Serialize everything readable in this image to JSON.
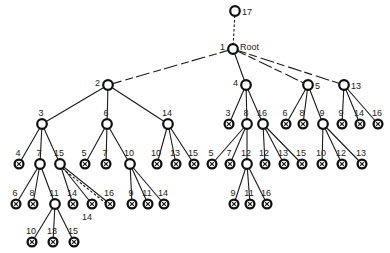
{
  "diagram": {
    "colors": {
      "line": "#1a1a1a",
      "node_stroke": "#111111",
      "node_fill": "#ffffff",
      "text": "#222222"
    },
    "legend": {
      "internal_node": "open circle",
      "leaf_node": "circle with cross (crossed-out)"
    },
    "nodes": [
      {
        "id": "n17",
        "label": "17",
        "x": 235,
        "y": 11,
        "type": "internal",
        "lpos": "right"
      },
      {
        "id": "n1",
        "label": "1",
        "sublabel": "Root",
        "x": 233,
        "y": 49,
        "type": "internal",
        "lpos": "left"
      },
      {
        "id": "n2",
        "label": "2",
        "x": 108,
        "y": 85,
        "type": "internal",
        "lpos": "left"
      },
      {
        "id": "n4",
        "label": "4",
        "x": 246,
        "y": 85,
        "type": "internal",
        "lpos": "left"
      },
      {
        "id": "n5",
        "label": "5",
        "x": 308,
        "y": 85,
        "type": "internal",
        "lpos": "right"
      },
      {
        "id": "n13",
        "label": "13",
        "x": 344,
        "y": 85,
        "type": "internal",
        "lpos": "right"
      },
      {
        "id": "a3",
        "label": "3",
        "x": 42,
        "y": 124,
        "type": "internal"
      },
      {
        "id": "a6",
        "label": "6",
        "x": 107,
        "y": 124,
        "type": "internal"
      },
      {
        "id": "a14",
        "label": "14",
        "x": 168,
        "y": 124,
        "type": "internal"
      },
      {
        "id": "b3",
        "label": "3",
        "x": 229,
        "y": 124,
        "type": "leaf"
      },
      {
        "id": "b8",
        "label": "8",
        "x": 247,
        "y": 124,
        "type": "internal"
      },
      {
        "id": "b16",
        "label": "16",
        "x": 263,
        "y": 124,
        "type": "internal"
      },
      {
        "id": "c6",
        "label": "6",
        "x": 286,
        "y": 124,
        "type": "leaf"
      },
      {
        "id": "c8",
        "label": "8",
        "x": 303,
        "y": 124,
        "type": "leaf"
      },
      {
        "id": "c9",
        "label": "9",
        "x": 323,
        "y": 124,
        "type": "internal"
      },
      {
        "id": "d9",
        "label": "9",
        "x": 342,
        "y": 124,
        "type": "leaf"
      },
      {
        "id": "d14",
        "label": "14",
        "x": 360,
        "y": 124,
        "type": "leaf"
      },
      {
        "id": "d16",
        "label": "16",
        "x": 378,
        "y": 124,
        "type": "leaf"
      },
      {
        "id": "e4",
        "label": "4",
        "x": 19,
        "y": 164,
        "type": "leaf"
      },
      {
        "id": "e7",
        "label": "7",
        "x": 40,
        "y": 164,
        "type": "internal"
      },
      {
        "id": "e15",
        "label": "15",
        "x": 60,
        "y": 164,
        "type": "internal"
      },
      {
        "id": "f5",
        "label": "5",
        "x": 85,
        "y": 164,
        "type": "leaf"
      },
      {
        "id": "f7",
        "label": "7",
        "x": 106,
        "y": 164,
        "type": "leaf"
      },
      {
        "id": "f10",
        "label": "10",
        "x": 130,
        "y": 164,
        "type": "internal"
      },
      {
        "id": "g10",
        "label": "10",
        "x": 157,
        "y": 164,
        "type": "leaf"
      },
      {
        "id": "g13",
        "label": "13",
        "x": 176,
        "y": 164,
        "type": "leaf"
      },
      {
        "id": "g15",
        "label": "15",
        "x": 194,
        "y": 164,
        "type": "leaf"
      },
      {
        "id": "h5",
        "label": "5",
        "x": 212,
        "y": 164,
        "type": "leaf"
      },
      {
        "id": "h7",
        "label": "7",
        "x": 230,
        "y": 164,
        "type": "leaf"
      },
      {
        "id": "h12",
        "label": "12",
        "x": 247,
        "y": 164,
        "type": "internal"
      },
      {
        "id": "i12",
        "label": "12",
        "x": 265,
        "y": 164,
        "type": "leaf"
      },
      {
        "id": "i13",
        "label": "13",
        "x": 284,
        "y": 164,
        "type": "leaf"
      },
      {
        "id": "i15",
        "label": "15",
        "x": 302,
        "y": 164,
        "type": "leaf"
      },
      {
        "id": "j10",
        "label": "10",
        "x": 322,
        "y": 164,
        "type": "leaf"
      },
      {
        "id": "j12",
        "label": "12",
        "x": 342,
        "y": 164,
        "type": "leaf"
      },
      {
        "id": "j13",
        "label": "13",
        "x": 362,
        "y": 164,
        "type": "leaf"
      },
      {
        "id": "k6",
        "label": "6",
        "x": 16,
        "y": 204,
        "type": "leaf"
      },
      {
        "id": "k8",
        "label": "8",
        "x": 33,
        "y": 204,
        "type": "leaf"
      },
      {
        "id": "k11",
        "label": "11",
        "x": 55,
        "y": 204,
        "type": "internal"
      },
      {
        "id": "l14",
        "label": "14",
        "x": 73,
        "y": 204,
        "type": "leaf"
      },
      {
        "id": "l14b",
        "label": "14",
        "x": 92,
        "y": 204,
        "type": "leaf",
        "lpos": "below"
      },
      {
        "id": "l16",
        "label": "16",
        "x": 110,
        "y": 204,
        "type": "leaf"
      },
      {
        "id": "m9",
        "label": "9",
        "x": 132,
        "y": 204,
        "type": "leaf"
      },
      {
        "id": "m11",
        "label": "11",
        "x": 148,
        "y": 204,
        "type": "leaf"
      },
      {
        "id": "m14",
        "label": "14",
        "x": 164,
        "y": 204,
        "type": "leaf"
      },
      {
        "id": "o9",
        "label": "9",
        "x": 234,
        "y": 204,
        "type": "leaf"
      },
      {
        "id": "o11",
        "label": "11",
        "x": 250,
        "y": 204,
        "type": "leaf"
      },
      {
        "id": "o16",
        "label": "16",
        "x": 267,
        "y": 204,
        "type": "leaf"
      },
      {
        "id": "p10",
        "label": "10",
        "x": 32,
        "y": 242,
        "type": "leaf"
      },
      {
        "id": "p13",
        "label": "13",
        "x": 53,
        "y": 242,
        "type": "leaf"
      },
      {
        "id": "p15",
        "label": "15",
        "x": 74,
        "y": 242,
        "type": "leaf"
      }
    ],
    "edges": [
      {
        "from": "n17",
        "to": "n1",
        "style": "dashed"
      },
      {
        "from": "n1",
        "to": "n2",
        "style": "broken"
      },
      {
        "from": "n1",
        "to": "n4",
        "style": "solid"
      },
      {
        "from": "n1",
        "to": "n5",
        "style": "broken"
      },
      {
        "from": "n1",
        "to": "n13",
        "style": "broken"
      },
      {
        "from": "n2",
        "to": "a3",
        "style": "solid"
      },
      {
        "from": "n2",
        "to": "a6",
        "style": "solid"
      },
      {
        "from": "n2",
        "to": "a14",
        "style": "solid"
      },
      {
        "from": "n4",
        "to": "b3",
        "style": "solid"
      },
      {
        "from": "n4",
        "to": "b8",
        "style": "solid"
      },
      {
        "from": "n4",
        "to": "b16",
        "style": "solid"
      },
      {
        "from": "n5",
        "to": "c6",
        "style": "solid"
      },
      {
        "from": "n5",
        "to": "c8",
        "style": "solid"
      },
      {
        "from": "n5",
        "to": "c9",
        "style": "solid"
      },
      {
        "from": "n13",
        "to": "d9",
        "style": "solid"
      },
      {
        "from": "n13",
        "to": "d14",
        "style": "solid"
      },
      {
        "from": "n13",
        "to": "d16",
        "style": "solid"
      },
      {
        "from": "a3",
        "to": "e4",
        "style": "solid"
      },
      {
        "from": "a3",
        "to": "e7",
        "style": "solid"
      },
      {
        "from": "a3",
        "to": "e15",
        "style": "solid"
      },
      {
        "from": "a6",
        "to": "f5",
        "style": "solid"
      },
      {
        "from": "a6",
        "to": "f7",
        "style": "solid"
      },
      {
        "from": "a6",
        "to": "f10",
        "style": "solid"
      },
      {
        "from": "a14",
        "to": "g10",
        "style": "solid"
      },
      {
        "from": "a14",
        "to": "g13",
        "style": "solid"
      },
      {
        "from": "a14",
        "to": "g15",
        "style": "solid"
      },
      {
        "from": "b8",
        "to": "h5",
        "style": "solid"
      },
      {
        "from": "b8",
        "to": "h7",
        "style": "solid"
      },
      {
        "from": "b8",
        "to": "h12",
        "style": "solid"
      },
      {
        "from": "b16",
        "to": "i12",
        "style": "solid"
      },
      {
        "from": "b16",
        "to": "i13",
        "style": "solid"
      },
      {
        "from": "b16",
        "to": "i15",
        "style": "solid"
      },
      {
        "from": "c9",
        "to": "j10",
        "style": "solid"
      },
      {
        "from": "c9",
        "to": "j12",
        "style": "solid"
      },
      {
        "from": "c9",
        "to": "j13",
        "style": "solid"
      },
      {
        "from": "e7",
        "to": "k6",
        "style": "solid"
      },
      {
        "from": "e7",
        "to": "k8",
        "style": "solid"
      },
      {
        "from": "e7",
        "to": "k11",
        "style": "solid"
      },
      {
        "from": "e15",
        "to": "l14",
        "style": "solid"
      },
      {
        "from": "e15",
        "to": "l14b",
        "style": "solid"
      },
      {
        "from": "e15",
        "to": "l16",
        "style": "solid"
      },
      {
        "from": "e15",
        "to": "l16",
        "style": "dashed",
        "offset": 2
      },
      {
        "from": "f10",
        "to": "m9",
        "style": "solid"
      },
      {
        "from": "f10",
        "to": "m11",
        "style": "solid"
      },
      {
        "from": "f10",
        "to": "m14",
        "style": "solid"
      },
      {
        "from": "h12",
        "to": "o9",
        "style": "solid"
      },
      {
        "from": "h12",
        "to": "o11",
        "style": "solid"
      },
      {
        "from": "h12",
        "to": "o16",
        "style": "solid"
      },
      {
        "from": "k11",
        "to": "p10",
        "style": "solid"
      },
      {
        "from": "k11",
        "to": "p13",
        "style": "solid"
      },
      {
        "from": "k11",
        "to": "p15",
        "style": "solid"
      }
    ]
  }
}
